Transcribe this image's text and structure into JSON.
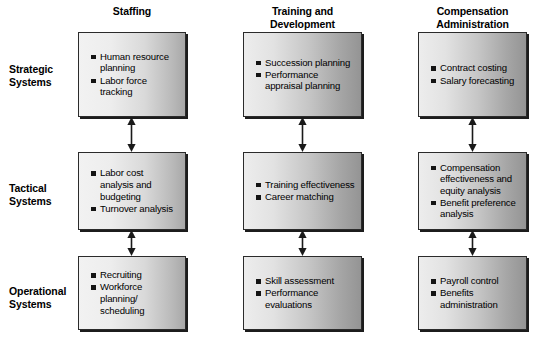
{
  "diagram": {
    "column_headers": [
      "Staffing",
      "Training and Development",
      "Compensation Administration"
    ],
    "row_labels": [
      "Strategic Systems",
      "Tactical Systems",
      "Operational Systems"
    ],
    "cells": [
      [
        {
          "items": [
            "Human resource planning",
            "Labor force tracking"
          ]
        },
        {
          "items": [
            "Succession planning",
            "Performance appraisal planning"
          ]
        },
        {
          "items": [
            "Contract costing",
            "Salary forecasting"
          ]
        }
      ],
      [
        {
          "items": [
            "Labor cost analysis and budgeting",
            "Turnover analysis"
          ]
        },
        {
          "items": [
            "Training effectiveness",
            "Career matching"
          ]
        },
        {
          "items": [
            "Compensation effectiveness and equity analysis",
            "Benefit preference analysis"
          ]
        }
      ],
      [
        {
          "items": [
            "Recruiting",
            "Workforce planning/ scheduling"
          ]
        },
        {
          "items": [
            "Skill assessment",
            "Performance evaluations"
          ]
        },
        {
          "items": [
            "Payroll control",
            "Benefits administration"
          ]
        }
      ]
    ],
    "connectors": {
      "type": "double-headed-vertical-arrow",
      "count": 6,
      "description": "Double-headed vertical arrows link each box to the box below it within the same column"
    },
    "colors": {
      "box_border": "#2b2b2b",
      "box_shadow": "#1c1c1c",
      "bullet": "#141414",
      "text": "#000000",
      "background": "#ffffff"
    }
  }
}
